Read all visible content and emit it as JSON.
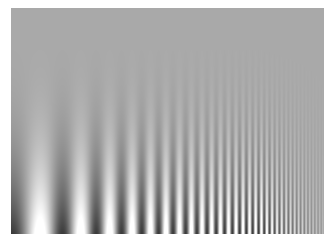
{
  "image": {
    "type": "campbell-robson-contrast-sensitivity-chart",
    "background_color": "#ffffff",
    "mid_gray": "#a9a9a9"
  },
  "grating": {
    "x": 11,
    "y": 8,
    "width": 313,
    "height": 226,
    "mean_luminance": 169,
    "orientation": "vertical",
    "frequency_axis": "horizontal, increasing left to right (logarithmic sweep)",
    "contrast_axis": "vertical, increasing top to bottom",
    "start_period_px": 66,
    "end_period_px": 3,
    "start_phase": 0.5,
    "max_amplitude": 110,
    "contrast_exponent": 3.2
  }
}
